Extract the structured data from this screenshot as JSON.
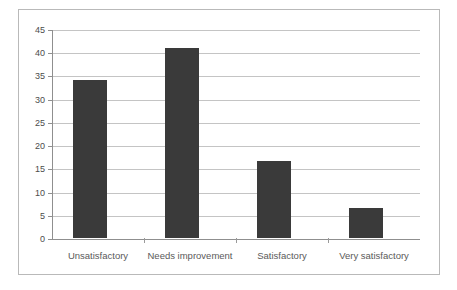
{
  "chart_data": {
    "type": "bar",
    "title": "",
    "subtitle": "",
    "xlabel": "",
    "ylabel": "",
    "categories": [
      "Unsatisfactory",
      "Needs improvement",
      "Satisfactory",
      "Very satisfactory"
    ],
    "values": [
      34,
      41,
      16.5,
      6.5
    ],
    "ylim": [
      0,
      45
    ],
    "ytick_step": 5,
    "yticks": [
      0,
      5,
      10,
      15,
      20,
      25,
      30,
      35,
      40,
      45
    ],
    "ytick_labels": [
      "0",
      "5",
      "10",
      "15",
      "20",
      "25",
      "30",
      "35",
      "40",
      "45"
    ],
    "grid": "horizontal",
    "legend": "none",
    "bar_color": "#3a3a3a",
    "gridline_color": "#c4c4c4",
    "axis_color": "#8f8f8f",
    "frame_color": "#b9b9b9",
    "background_color": "#ffffff",
    "annotations": []
  }
}
